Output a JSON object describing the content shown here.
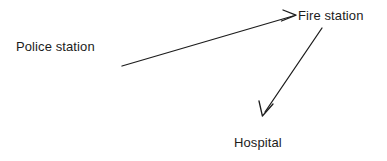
{
  "diagram": {
    "background_color": "#ffffff",
    "stroke_color": "#1c1c1c",
    "text_color": "#1c1c1c",
    "nodes": [
      {
        "id": "police-station",
        "label": "Police station",
        "x": 16,
        "y": 39
      },
      {
        "id": "fire-station",
        "label": "Fire station",
        "x": 298,
        "y": 8
      },
      {
        "id": "hospital",
        "label": "Hospital",
        "x": 234,
        "y": 135
      }
    ],
    "arrows": [
      {
        "id": "police-station-to-fire-station",
        "from": "police-station",
        "to": "fire-station",
        "label": "",
        "start": {
          "x": 122,
          "y": 66
        },
        "end": {
          "x": 296,
          "y": 15
        },
        "head": "open-v"
      },
      {
        "id": "fire-station-to-hospital",
        "from": "fire-station",
        "to": "hospital",
        "label": "",
        "start": {
          "x": 322,
          "y": 28
        },
        "end": {
          "x": 262,
          "y": 116
        },
        "head": "open-v"
      }
    ]
  }
}
